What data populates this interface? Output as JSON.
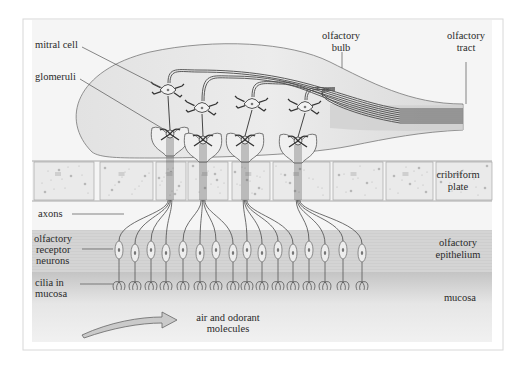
{
  "diagram": {
    "colors": {
      "frame_border": "#d6d6d6",
      "panel_bg": "#f4f4f4",
      "bulb_fill": "#e6e6e6",
      "bone_fill": "#ececec",
      "epithelium_fill": "#d2d2d2",
      "mucosa_top": "#c6c6c6",
      "mucosa_bottom": "#efefef",
      "line": "#555555",
      "text": "#2a2a2a",
      "arrow_fill": "#c8c8c8"
    },
    "labels": {
      "mitral_cell": "mitral cell",
      "glomeruli": "glomeruli",
      "olfactory_bulb_1": "olfactory",
      "olfactory_bulb_2": "bulb",
      "olfactory_tract_1": "olfactory",
      "olfactory_tract_2": "tract",
      "cribriform_plate_1": "cribriform",
      "cribriform_plate_2": "plate",
      "axons": "axons",
      "receptor_neurons_1": "olfactory",
      "receptor_neurons_2": "receptor",
      "receptor_neurons_3": "neurons",
      "cilia_1": "cilia in",
      "cilia_2": "mucosa",
      "epithelium_1": "olfactory",
      "epithelium_2": "epithelium",
      "mucosa": "mucosa",
      "air_1": "air and odorant",
      "air_2": "molecules"
    },
    "regions": [
      {
        "name": "olfactory bulb",
        "y_range": [
          45,
          158
        ]
      },
      {
        "name": "cribriform plate",
        "y_range": [
          160,
          200
        ]
      },
      {
        "name": "olfactory epithelium",
        "y_range": [
          230,
          272
        ]
      },
      {
        "name": "mucosa",
        "y_range": [
          272,
          342
        ]
      }
    ],
    "mitral_cells": [
      {
        "x": 168,
        "y": 90
      },
      {
        "x": 202,
        "y": 108
      },
      {
        "x": 252,
        "y": 104
      },
      {
        "x": 305,
        "y": 107
      }
    ],
    "glomeruli": [
      {
        "x": 170,
        "y": 134
      },
      {
        "x": 203,
        "y": 140
      },
      {
        "x": 245,
        "y": 140
      },
      {
        "x": 298,
        "y": 141
      }
    ],
    "receptor_neuron_x": [
      119,
      135,
      151,
      166,
      183,
      200,
      216,
      233,
      247,
      262,
      278,
      293,
      309,
      325,
      343,
      362
    ],
    "receptor_neuron_count": 16
  }
}
